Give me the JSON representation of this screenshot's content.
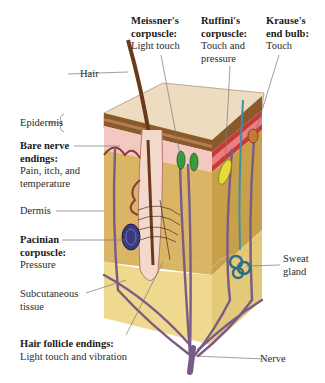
{
  "diagram": {
    "type": "anatomical illustration",
    "colors": {
      "epidermis_top": "#eedcc0",
      "epidermis_band": "#8b5a2b",
      "dermis_pink": "#f1c9c1",
      "dermis": "#d9b565",
      "subcutaneous": "#efd98e",
      "nerve": "#7a5a86",
      "meissner": "#3c9a3c",
      "ruffini": "#e6dc3c",
      "pacinian": "#3a3a80",
      "sweat_gland": "#3f8fa8",
      "hair": "#6b3a1d"
    }
  },
  "labels": {
    "hair": {
      "title": "Hair"
    },
    "epidermis": {
      "title": "Epidermis"
    },
    "bare_nerve": {
      "title_line1": "Bare nerve",
      "title_line2": "endings:",
      "desc_line1": "Pain, itch, and",
      "desc_line2": "temperature"
    },
    "dermis": {
      "title": "Dermis"
    },
    "pacinian": {
      "title_line1": "Pacinian",
      "title_line2": "corpuscle:",
      "desc": "Pressure"
    },
    "subcutaneous": {
      "line1": "Subcutaneous",
      "line2": "tissue"
    },
    "hair_follicle": {
      "title": "Hair follicle endings:",
      "desc": "Light touch and vibration"
    },
    "meissner": {
      "title_line1": "Meissner's",
      "title_line2": "corpuscle:",
      "desc": "Light touch"
    },
    "ruffini": {
      "title_line1": "Ruffini's",
      "title_line2": "corpuscle:",
      "desc_line1": "Touch and",
      "desc_line2": "pressure"
    },
    "krause": {
      "title_line1": "Krause's",
      "title_line2": "end bulb:",
      "desc": "Touch"
    },
    "sweat_gland": {
      "line1": "Sweat",
      "line2": "gland"
    },
    "nerve": {
      "title": "Nerve"
    }
  }
}
